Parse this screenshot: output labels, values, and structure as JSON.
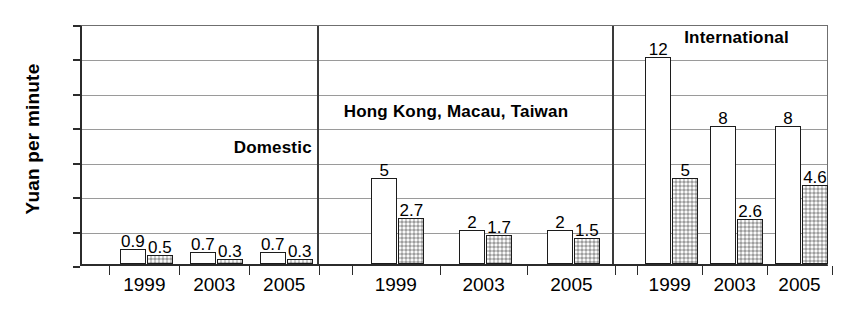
{
  "chart_data": {
    "type": "bar",
    "title": "",
    "xlabel": "",
    "ylabel": "Yuan per minute",
    "ylim": [
      0,
      14
    ],
    "yticks": [
      0,
      2,
      4,
      6,
      8,
      10,
      12,
      14
    ],
    "grid": true,
    "legend_position": "none",
    "categories": [
      "1999",
      "2003",
      "2005"
    ],
    "series": [
      {
        "name": "white-bar",
        "style": "white-outlined"
      },
      {
        "name": "grey-bar",
        "style": "grey-stippled"
      }
    ],
    "panels": [
      {
        "label": "Domestic",
        "label_x_frac": 0.255,
        "label_value": 7.0,
        "groups": [
          {
            "category": "1999",
            "values": [
              0.9,
              0.5
            ],
            "labels": [
              "0.9",
              "0.5"
            ]
          },
          {
            "category": "2003",
            "values": [
              0.7,
              0.3
            ],
            "labels": [
              "0.7",
              "0.3"
            ]
          },
          {
            "category": "2005",
            "values": [
              0.7,
              0.3
            ],
            "labels": [
              "0.7",
              "0.3"
            ]
          }
        ]
      },
      {
        "label": "Hong Kong, Macau, Taiwan",
        "label_x_frac": 0.5,
        "label_value": 9.05,
        "groups": [
          {
            "category": "1999",
            "values": [
              5,
              2.7
            ],
            "labels": [
              "5",
              "2.7"
            ]
          },
          {
            "category": "2003",
            "values": [
              2,
              1.7
            ],
            "labels": [
              "2",
              "1.7"
            ]
          },
          {
            "category": "2005",
            "values": [
              2,
              1.5
            ],
            "labels": [
              "2",
              "1.5"
            ]
          }
        ]
      },
      {
        "label": "International",
        "label_x_frac": 0.875,
        "label_value": 13.35,
        "groups": [
          {
            "category": "1999",
            "values": [
              12,
              5
            ],
            "labels": [
              "12",
              "5"
            ]
          },
          {
            "category": "2003",
            "values": [
              8,
              2.6
            ],
            "labels": [
              "8",
              "2.6"
            ]
          },
          {
            "category": "2005",
            "values": [
              8,
              4.6
            ],
            "labels": [
              "8",
              "4.6"
            ]
          }
        ]
      }
    ]
  },
  "axis": {
    "y_title": "Yuan per minute"
  }
}
